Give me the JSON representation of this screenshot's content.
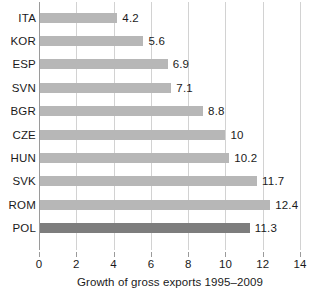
{
  "chart_data": {
    "type": "bar",
    "orientation": "horizontal",
    "title": "",
    "xlabel": "Growth of gross exports 1995–2009",
    "ylabel": "",
    "xlim": [
      0,
      14
    ],
    "xticks": [
      0,
      2,
      4,
      6,
      8,
      10,
      12,
      14
    ],
    "xtick_labels": [
      "0",
      "2",
      "4",
      "6",
      "8",
      "10",
      "12",
      "14"
    ],
    "grid": true,
    "grid_axis": "x",
    "legend": false,
    "categories": [
      "ITA",
      "KOR",
      "ESP",
      "SVN",
      "BGR",
      "CZE",
      "HUN",
      "SVK",
      "ROM",
      "POL"
    ],
    "values": [
      4.2,
      5.6,
      6.9,
      7.1,
      8.8,
      10,
      10.2,
      11.7,
      12.4,
      11.3
    ],
    "value_labels": [
      "4.2",
      "5.6",
      "6.9",
      "7.1",
      "8.8",
      "10",
      "10.2",
      "11.7",
      "12.4",
      "11.3"
    ],
    "bar_colors": [
      "#b7b7b7",
      "#b7b7b7",
      "#b7b7b7",
      "#b7b7b7",
      "#b7b7b7",
      "#b7b7b7",
      "#b7b7b7",
      "#b7b7b7",
      "#b7b7b7",
      "#7d7d7d"
    ],
    "highlight_category": "POL",
    "colors": {
      "bar_default": "#b7b7b7",
      "bar_highlight": "#7d7d7d",
      "gridline": "#d2d2d2",
      "axis": "#9a9a9a",
      "text": "#1a1a1a",
      "background": "#ffffff"
    }
  }
}
